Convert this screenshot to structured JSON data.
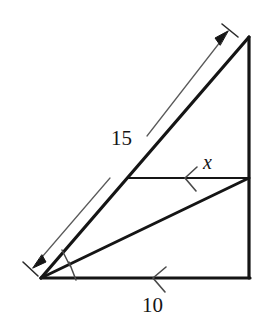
{
  "figure": {
    "type": "geometry-diagram",
    "background_color": "#ffffff",
    "stroke_color": "#151515",
    "dimension_stroke_color": "#555555",
    "labels": {
      "hypotenuse": "15",
      "base": "10",
      "mid_segment": "x"
    },
    "vertices": {
      "apex_top_right": {
        "x": 249,
        "y": 37
      },
      "bottom_left": {
        "x": 41,
        "y": 278
      },
      "bottom_right": {
        "x": 249,
        "y": 278
      },
      "mid_left_on_hypotenuse": {
        "x": 128,
        "y": 178
      },
      "mid_right_on_vertical": {
        "x": 249,
        "y": 178
      }
    },
    "segments": [
      {
        "name": "hypotenuse",
        "from": "bottom_left",
        "to": "apex_top_right",
        "label": "15",
        "weight": "thick"
      },
      {
        "name": "right-vertical-leg",
        "from": "apex_top_right",
        "to": "bottom_right",
        "label": "",
        "weight": "thick"
      },
      {
        "name": "base-leg",
        "from": "bottom_left",
        "to": "bottom_right",
        "label": "10",
        "weight": "thick"
      },
      {
        "name": "mid-horizontal-segment",
        "from": "mid_left_on_hypotenuse",
        "to": "mid_right_on_vertical",
        "label": "x",
        "weight": "thin"
      },
      {
        "name": "angle-bisector",
        "from": "bottom_left",
        "to": "mid_right_on_vertical",
        "label": "",
        "weight": "thick"
      }
    ],
    "dimension_line": {
      "name": "hypotenuse-dimension",
      "label": "15",
      "arrow_heads": "both",
      "start": {
        "x": 33,
        "y": 268
      },
      "end": {
        "x": 228,
        "y": 32
      }
    },
    "angle_marks": {
      "name": "equal-angle-ticks",
      "count": 2,
      "meaning": "angle bisector: two equal angles at bottom-left vertex"
    },
    "direction_markers": [
      {
        "name": "mid-segment-chevron",
        "on": "mid-horizontal-segment",
        "points": "left"
      },
      {
        "name": "base-chevron",
        "on": "base-leg",
        "points": "left"
      }
    ]
  }
}
